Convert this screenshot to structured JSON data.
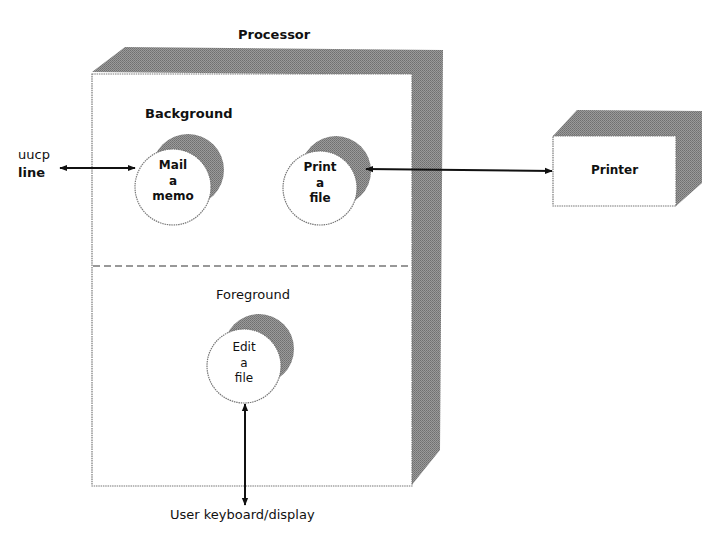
{
  "diagram": {
    "processor": {
      "title": "Processor",
      "background_section": {
        "label": "Background"
      },
      "foreground_section": {
        "label": "Foreground"
      }
    },
    "processes": [
      {
        "id": "mail",
        "lines": [
          "Mail",
          "a",
          "memo"
        ],
        "section": "Background"
      },
      {
        "id": "print",
        "lines": [
          "Print",
          "a",
          "file"
        ],
        "section": "Background"
      },
      {
        "id": "edit",
        "lines": [
          "Edit",
          "a",
          "file"
        ],
        "section": "Foreground"
      }
    ],
    "external": {
      "uucp": {
        "line1": "uucp",
        "line2": "line"
      },
      "printer": {
        "label": "Printer"
      },
      "user": {
        "label": "User keyboard/display"
      }
    },
    "connections": [
      {
        "from": "uucp line",
        "to": "Mail a memo",
        "type": "bidirectional"
      },
      {
        "from": "Print a file",
        "to": "Printer",
        "type": "bidirectional"
      },
      {
        "from": "Edit a file",
        "to": "User keyboard/display",
        "type": "bidirectional"
      }
    ],
    "colors": {
      "shadow": "#8a8a8a",
      "outline": "#6e6e6e",
      "line": "#111111",
      "background": "#ffffff"
    }
  }
}
